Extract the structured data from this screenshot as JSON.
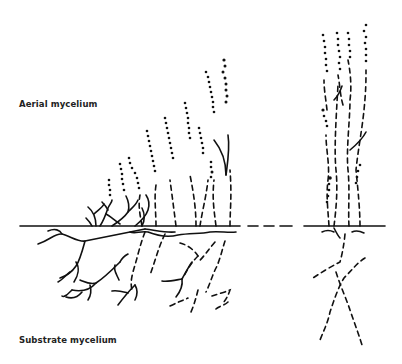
{
  "diagram": {
    "type": "biological illustration",
    "labels": {
      "aerial": "Aerial mycelium",
      "substrate": "Substrate mycelium"
    },
    "regions": [
      {
        "name": "left-colony",
        "description": "progressively taller aerial hyphae with spore chains, branching substrate mycelium below"
      },
      {
        "name": "gap",
        "description": "dashed surface line indicating omitted section"
      },
      {
        "name": "right-colony",
        "description": "tall mature aerial hyphae bundle with spore chains, sparse dashed substrate hyphae below"
      }
    ],
    "colors": {
      "ink": "#111111",
      "background": "#ffffff"
    }
  }
}
